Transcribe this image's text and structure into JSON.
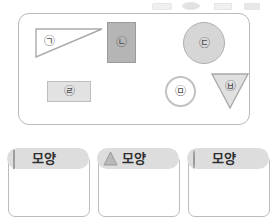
{
  "worksheet": {
    "top_strip": {
      "description": "cut-off partial row above the main panel",
      "visible": true
    },
    "shape_panel": {
      "border_color": "#b9b9b9",
      "background": "#ffffff",
      "shapes": [
        {
          "id": "shape-a",
          "label": "㉠",
          "jamo": "ㄱ",
          "form": "right-triangle",
          "fill": "#ffffff",
          "stroke": "#aaaaaa",
          "category": "triangle"
        },
        {
          "id": "shape-b",
          "label": "㉡",
          "jamo": "ㄴ",
          "form": "rectangle",
          "fill": "#b5b5b5",
          "stroke": "#9a9a9a",
          "category": "square"
        },
        {
          "id": "shape-c",
          "label": "㉢",
          "jamo": "ㄷ",
          "form": "circle",
          "fill": "#d6d6d6",
          "stroke": "#b0b0b0",
          "category": "circle"
        },
        {
          "id": "shape-d",
          "label": "㉣",
          "jamo": "ㄹ",
          "form": "rectangle",
          "fill": "#e2e2e2",
          "stroke": "#bdbdbd",
          "category": "square"
        },
        {
          "id": "shape-e",
          "label": "㉤",
          "jamo": "ㅁ",
          "form": "circle-outline",
          "fill": "#ffffff",
          "stroke": "#c2c2c2",
          "category": "circle"
        },
        {
          "id": "shape-f",
          "label": "㉥",
          "jamo": "ㅂ",
          "form": "inverted-triangle",
          "fill": "#e0e0e0",
          "stroke": "#a8a8a8",
          "category": "triangle"
        }
      ]
    },
    "sort_cards": [
      {
        "id": "card-square",
        "icon": "square-icon",
        "label": "모양",
        "header_fill": "#dddddd",
        "icon_fill": "#bdbdbd",
        "contents": []
      },
      {
        "id": "card-triangle",
        "icon": "triangle-icon",
        "label": "모양",
        "header_fill": "#dddddd",
        "icon_fill": "#b9b9b9",
        "contents": []
      },
      {
        "id": "card-circle",
        "icon": "circle-icon",
        "label": "모양",
        "header_fill": "#dddddd",
        "icon_fill": "#b9b9b9",
        "contents": []
      }
    ]
  }
}
